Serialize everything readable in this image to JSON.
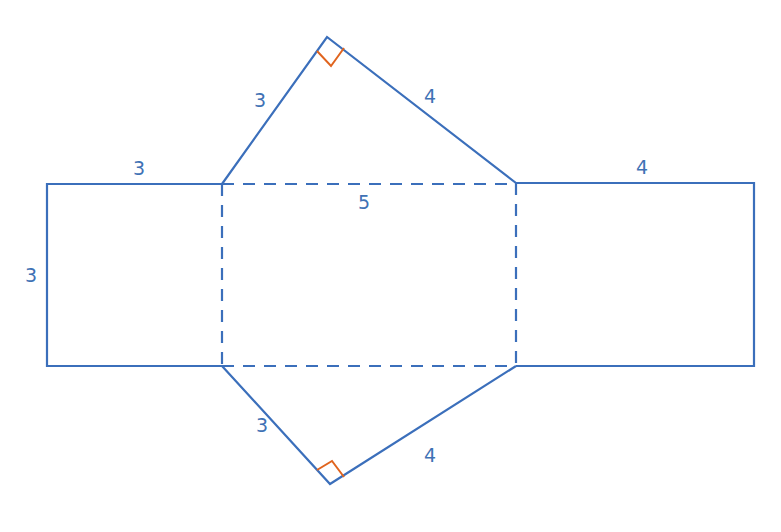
{
  "diagram": {
    "colors": {
      "line": "#3b6fbb",
      "label": "#3f72b5",
      "right_angle": "#e0641e",
      "background": "#ffffff"
    },
    "labels": {
      "top_triangle_left": "3",
      "top_triangle_right": "4",
      "left_rect_top": "3",
      "left_rect_side": "3",
      "center_rect_top": "5",
      "right_rect_top": "4",
      "bottom_triangle_left": "3",
      "bottom_triangle_right": "4"
    },
    "shapes": [
      {
        "name": "left-square",
        "width": 3,
        "height": 3
      },
      {
        "name": "center-rectangle",
        "width": 5,
        "height": 3,
        "edges": "dashed"
      },
      {
        "name": "right-rectangle",
        "width": 4,
        "height": 3
      },
      {
        "name": "top-triangle",
        "sides": [
          3,
          4,
          5
        ],
        "right_angle": true
      },
      {
        "name": "bottom-triangle",
        "sides": [
          3,
          4,
          5
        ],
        "right_angle": true
      }
    ]
  }
}
